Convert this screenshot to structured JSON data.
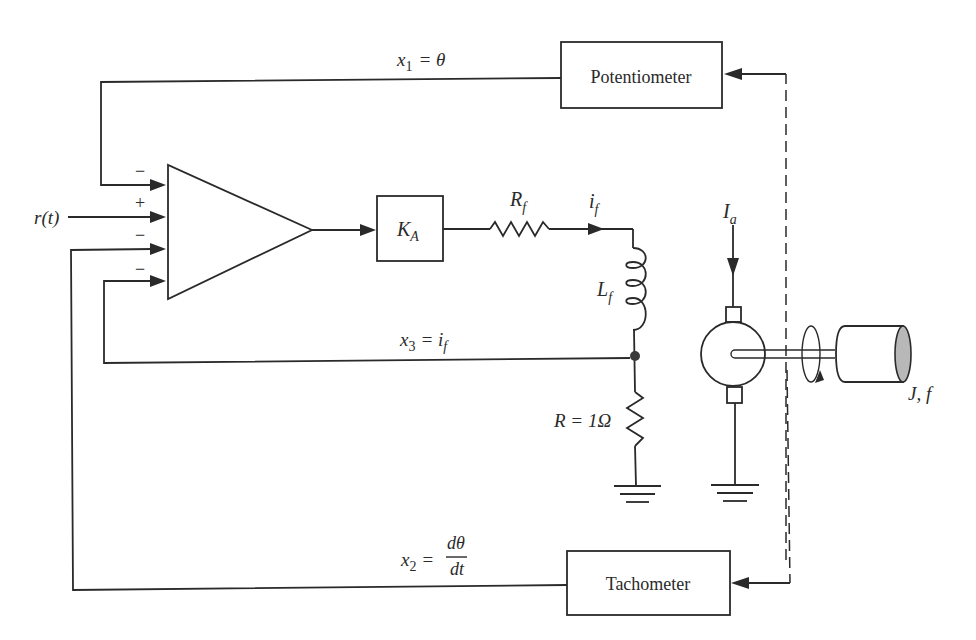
{
  "diagram": {
    "type": "DC motor position control system with state-variable feedback",
    "blocks": {
      "potentiometer": "Potentiometer",
      "tachometer": "Tachometer",
      "amplifier_gain": {
        "base": "K",
        "sub": "A"
      }
    },
    "summing_signs": [
      "−",
      "+",
      "−",
      "−"
    ],
    "input_label": "r(t)",
    "feedback_signals": {
      "x1": {
        "var": "x",
        "sub": "1",
        "rhs": "= θ"
      },
      "x2": {
        "var": "x",
        "sub": "2",
        "rhs_prefix": "=",
        "numerator": "dθ",
        "denominator": "dt"
      },
      "x3": {
        "var": "x",
        "sub": "3",
        "rhs_prefix": "= i",
        "rhs_sub": "f"
      }
    },
    "circuit": {
      "field_resistor": {
        "base": "R",
        "sub": "f"
      },
      "field_current": {
        "base": "i",
        "sub": "f"
      },
      "field_inductor": {
        "base": "L",
        "sub": "f"
      },
      "sense_resistor": "R = 1Ω",
      "armature_current": {
        "base": "I",
        "sub": "a"
      },
      "load": "J, f"
    },
    "icons": {
      "amplifier": "triangle-amplifier-icon",
      "resistor": "zigzag-resistor-icon",
      "inductor": "coil-inductor-icon",
      "ground": "ground-icon",
      "motor": "dc-motor-icon",
      "load": "cylinder-load-icon",
      "rotation": "rotation-arrow-icon"
    },
    "colors": {
      "ink": "#2a2a2a",
      "background": "#ffffff",
      "load_face": "#b8b8b8"
    }
  }
}
